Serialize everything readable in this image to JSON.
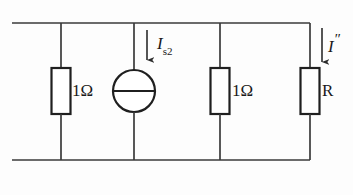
{
  "diagram": {
    "type": "electrical-schematic",
    "background_color": "#fdfdfd",
    "line_color": "#2b2b2b",
    "text_color": "#1a1a1a",
    "rails": {
      "top_y": 23,
      "bottom_y": 160,
      "left_x": 12,
      "right_x": 310
    },
    "branches": [
      {
        "id": "branch-resistor-1",
        "x": 61,
        "component": "resistor",
        "label": "1Ω",
        "label_x": 72,
        "label_y": 82
      },
      {
        "id": "branch-current-source",
        "x": 134,
        "component": "current-source",
        "label": "I",
        "subscript": "s2",
        "arrow_x": 147,
        "arrow_direction": "down"
      },
      {
        "id": "branch-resistor-2",
        "x": 220,
        "component": "resistor",
        "label": "1Ω",
        "label_x": 232,
        "label_y": 82
      },
      {
        "id": "branch-resistor-R",
        "x": 310,
        "component": "resistor",
        "label": "R",
        "arrow_x": 322,
        "arrow_direction": "down"
      }
    ],
    "components": {
      "resistor_1": {
        "label": "1Ω",
        "box": {
          "x": 51,
          "y": 68,
          "w": 20,
          "h": 46
        }
      },
      "resistor_2": {
        "label": "1Ω",
        "box": {
          "x": 210,
          "y": 68,
          "w": 20,
          "h": 46
        }
      },
      "resistor_R": {
        "label": "R",
        "box": {
          "x": 300,
          "y": 68,
          "w": 20,
          "h": 46
        }
      },
      "current_source": {
        "symbol": "circle-with-horizontal-bar",
        "cx": 134,
        "cy": 91,
        "r": 21
      }
    },
    "current_labels": {
      "source_current": {
        "symbol": "I",
        "subscript": "s2",
        "full": "I s2",
        "arrow": "down-arrow-icon"
      },
      "output_current": {
        "symbol": "I",
        "prime": "″",
        "full": "I″",
        "arrow": "down-arrow-icon"
      }
    }
  }
}
